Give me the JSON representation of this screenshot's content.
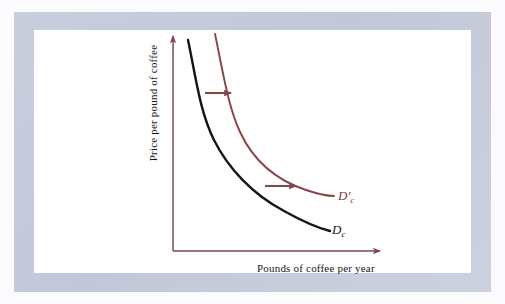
{
  "figure": {
    "kind": "economics-demand-shift-diagram",
    "background_color": "#fbfbfd",
    "frame_color": "#c6cbdb",
    "panel_color": "#ffffff"
  },
  "axes": {
    "color": "#7c4a4d",
    "y_label": "Price per pound of coffee",
    "x_label": "Pounds of coffee per year",
    "origin": {
      "x": 173,
      "y": 251
    },
    "y_top": {
      "x": 173,
      "y": 32
    },
    "x_right": {
      "x": 385,
      "y": 251
    }
  },
  "curves": [
    {
      "id": "original-demand-curve",
      "label_text": "D",
      "label_subscript": "c",
      "label_prime": "",
      "color": "#141419",
      "stroke_width": 2.4,
      "label_position": {
        "x": 332,
        "y": 222
      },
      "path_points": [
        {
          "x": 188,
          "y": 40
        },
        {
          "x": 205,
          "y": 95
        },
        {
          "x": 228,
          "y": 145
        },
        {
          "x": 262,
          "y": 185
        },
        {
          "x": 300,
          "y": 215
        },
        {
          "x": 330,
          "y": 231
        }
      ]
    },
    {
      "id": "shifted-demand-curve",
      "label_text": "D",
      "label_subscript": "c",
      "label_prime": "′",
      "color": "#8a4347",
      "stroke_width": 1.9,
      "label_position": {
        "x": 338,
        "y": 188
      },
      "path_points": [
        {
          "x": 215,
          "y": 34
        },
        {
          "x": 232,
          "y": 90
        },
        {
          "x": 252,
          "y": 135
        },
        {
          "x": 282,
          "y": 168
        },
        {
          "x": 312,
          "y": 188
        },
        {
          "x": 334,
          "y": 196
        }
      ]
    }
  ],
  "shift_arrows": [
    {
      "id": "upper-shift-arrow",
      "color": "#7c4a4d",
      "from": {
        "x": 205,
        "y": 93
      },
      "to": {
        "x": 236,
        "y": 93
      }
    },
    {
      "id": "lower-shift-arrow",
      "color": "#7c4a4d",
      "from": {
        "x": 265,
        "y": 186
      },
      "to": {
        "x": 301,
        "y": 186
      }
    }
  ]
}
